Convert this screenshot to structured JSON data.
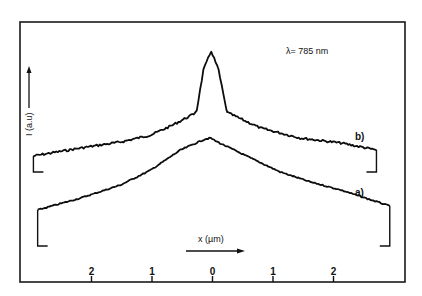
{
  "chart_data": {
    "type": "line",
    "title": "",
    "annotation": "λ= 785 nm",
    "xlabel": "x (µm)",
    "ylabel": "I (a.u)",
    "xlim": [
      -3.1,
      3.2
    ],
    "xticks": [
      -2,
      -1,
      0,
      1,
      2
    ],
    "xtick_labels": [
      "2",
      "1",
      "0",
      "1",
      "2"
    ],
    "ylim": [
      0,
      2.6
    ],
    "grid": false,
    "legend": "inline curve labels",
    "series": [
      {
        "name": "b)",
        "label": "b)",
        "x": [
          -2.96,
          -2.18,
          -1.52,
          -1.02,
          -0.69,
          -0.31,
          -0.26,
          -0.15,
          -0.02,
          0.1,
          0.23,
          0.26,
          0.79,
          1.45,
          2.12,
          2.71
        ],
        "y": [
          1.26,
          1.34,
          1.4,
          1.47,
          1.56,
          1.68,
          1.72,
          2.12,
          2.31,
          2.12,
          1.72,
          1.69,
          1.54,
          1.44,
          1.39,
          1.32
        ],
        "baseline": 1.1
      },
      {
        "name": "a)",
        "label": "a)",
        "x": [
          -2.89,
          -2.18,
          -1.52,
          -1.02,
          -0.53,
          -0.12,
          -0.03,
          0.05,
          0.63,
          1.12,
          1.62,
          2.12,
          2.93
        ],
        "y": [
          0.72,
          0.84,
          0.97,
          1.12,
          1.32,
          1.43,
          1.44,
          1.41,
          1.24,
          1.1,
          1.0,
          0.92,
          0.76
        ],
        "baseline": 0.36
      }
    ]
  }
}
